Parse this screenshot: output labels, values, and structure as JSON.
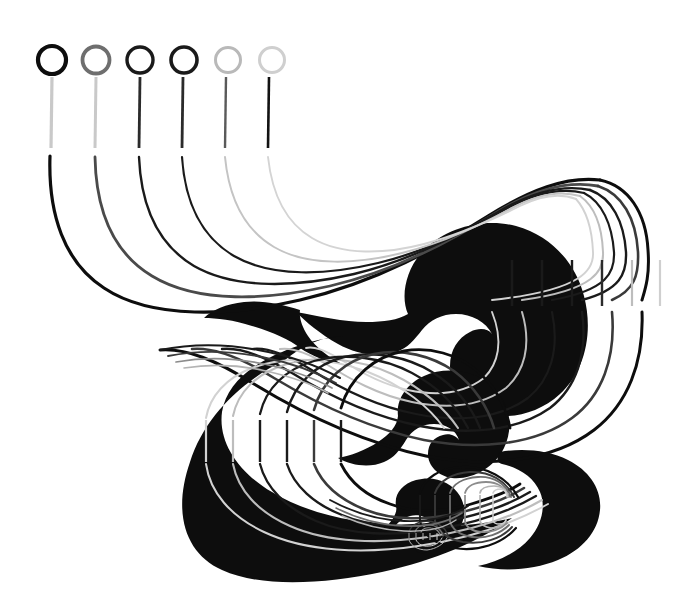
{
  "artwork": {
    "title": "Streamline Vortex Cascade",
    "background_color": "#ffffff",
    "width": 677,
    "height": 606,
    "medium": "abstract line drawing"
  },
  "palette": {
    "black": "#0d0d0d",
    "near_black": "#1a1a1a",
    "dark_gray": "#3a3a3a",
    "mid_gray": "#6e6e6e",
    "gray": "#8c8c8c",
    "light_gray": "#b4b4b4",
    "pale_gray": "#cfcfcf",
    "faint_gray": "#dedede",
    "white": "#ffffff"
  },
  "tracers": {
    "count": 6,
    "head_radius": 14,
    "first_center_x": 52,
    "center_y": 60,
    "spacing_x": 44,
    "stem_top_y": 76,
    "stem_bottom_y": 148,
    "items": [
      {
        "label": "tracer-1",
        "head_color": "#0d0d0d",
        "head_width": 4.2,
        "stem_color": "#c9c9c9",
        "stem_width": 3.2,
        "path_color": "#0d0d0d",
        "path_width": 3.2
      },
      {
        "label": "tracer-2",
        "head_color": "#6e6e6e",
        "head_width": 3.8,
        "stem_color": "#c9c9c9",
        "stem_width": 3.0,
        "path_color": "#4a4a4a",
        "path_width": 2.8
      },
      {
        "label": "tracer-3",
        "head_color": "#1a1a1a",
        "head_width": 3.4,
        "stem_color": "#2b2b2b",
        "stem_width": 2.8,
        "path_color": "#1a1a1a",
        "path_width": 2.4
      },
      {
        "label": "tracer-4",
        "head_color": "#1a1a1a",
        "head_width": 3.6,
        "stem_color": "#2b2b2b",
        "stem_width": 2.8,
        "path_color": "#1a1a1a",
        "path_width": 2.2
      },
      {
        "label": "tracer-5",
        "head_color": "#b9b9b9",
        "head_width": 3.0,
        "stem_color": "#5a5a5a",
        "stem_width": 2.4,
        "path_color": "#c4c4c4",
        "path_width": 2.0
      },
      {
        "label": "tracer-6",
        "head_color": "#cfcfcf",
        "head_width": 3.0,
        "stem_color": "#121212",
        "stem_width": 2.6,
        "path_color": "#d4d4d4",
        "path_width": 1.9
      }
    ]
  },
  "vortices": [
    {
      "label": "vortex-primary",
      "center_x": 470,
      "center_y": 355,
      "tick_x_start": 512,
      "tick_y": 260,
      "tick_height": 46,
      "tick_spacing": 30,
      "ring_count": 6,
      "ring_colors": [
        "#0d0d0d",
        "#3a3a3a",
        "#1a1a1a",
        "#1a1a1a",
        "#bdbdbd",
        "#d2d2d2"
      ],
      "ink_blob": "black hook-shaped core"
    },
    {
      "label": "vortex-secondary",
      "center_x": 330,
      "center_y": 440,
      "tick_x_start": 205,
      "tick_y": 420,
      "tick_height": 42,
      "tick_spacing": 27,
      "ring_count": 6,
      "ring_colors": [
        "#d2d2d2",
        "#bdbdbd",
        "#1a1a1a",
        "#1a1a1a",
        "#3a3a3a",
        "#0d0d0d"
      ],
      "ink_blob": "black spiral core opening right"
    },
    {
      "label": "vortex-tertiary",
      "center_x": 455,
      "center_y": 515,
      "tick_x_start": 418,
      "tick_y": 495,
      "tick_height": 26,
      "tick_spacing": 15,
      "ring_count": 6,
      "ring_colors": [
        "#0d0d0d",
        "#3a3a3a",
        "#6e6e6e",
        "#8c8c8c",
        "#b4b4b4",
        "#cfcfcf"
      ],
      "ink_blob": "small black comma core"
    },
    {
      "label": "vortex-quaternary",
      "center_x": 420,
      "center_y": 536,
      "tick_x_start": 408,
      "tick_y": 531,
      "tick_height": 10,
      "tick_spacing": 7,
      "ring_count": 5,
      "ring_colors": [
        "#3a3a3a",
        "#6e6e6e",
        "#8c8c8c",
        "#b4b4b4",
        "#cfcfcf"
      ],
      "ink_blob": "tiny nested core"
    }
  ],
  "legend": {
    "tracer_group_label": "tracer heads",
    "flow_label": "streamlines",
    "vortex_label": "nested vortices"
  }
}
